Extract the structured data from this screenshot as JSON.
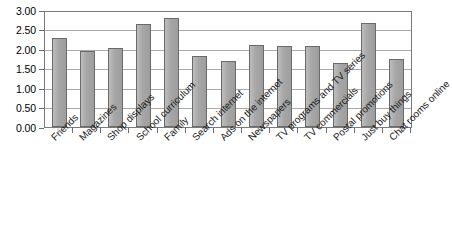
{
  "chart_data": {
    "type": "bar",
    "title": "",
    "subtitle": "",
    "xlabel": "",
    "ylabel": "",
    "ylim": [
      0,
      3.0
    ],
    "ytick_step": 0.5,
    "grid": true,
    "legend": false,
    "legend_position": "none",
    "orientation": "vertical",
    "bar_color": "#a9a9a9",
    "bar_border_color": "#6a6a6a",
    "gridline_color": "#a9a9a9",
    "axis_color": "#7a7a7a",
    "ytick_labels": [
      "3.00",
      "2.50",
      "2.00",
      "1.50",
      "1.00",
      "0.50",
      "0.00"
    ],
    "ytick_values": [
      3.0,
      2.5,
      2.0,
      1.5,
      1.0,
      0.5,
      0.0
    ],
    "categories": [
      "Friends",
      "Magazines",
      "Shop displays",
      "School curriculum",
      "Family",
      "Search internet",
      "Ads on the internet",
      "Newspapers",
      "TV programs and TV series",
      "TV commercials",
      "Postal promotions",
      "Just buy things",
      "Chat rooms online"
    ],
    "values": [
      2.31,
      1.99,
      2.06,
      2.69,
      2.85,
      1.85,
      1.72,
      2.14,
      2.11,
      2.1,
      1.66,
      2.7,
      1.77
    ]
  }
}
